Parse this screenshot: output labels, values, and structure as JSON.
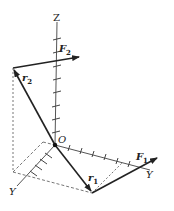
{
  "diagram": {
    "type": "3d-vector-diagram",
    "axes": {
      "z_label": "Z",
      "y_label": "Y",
      "x_label": "Y",
      "origin_label": "O"
    },
    "vectors": [
      {
        "name": "r1",
        "label": "r",
        "subscript": "1",
        "from": "O",
        "kind": "position"
      },
      {
        "name": "F1",
        "label": "F",
        "subscript": "1",
        "from": "tip of r1",
        "kind": "force"
      },
      {
        "name": "r2",
        "label": "r",
        "subscript": "2",
        "from": "O",
        "kind": "position"
      },
      {
        "name": "F2",
        "label": "F",
        "subscript": "2",
        "from": "tip of r2",
        "kind": "force"
      }
    ],
    "colors": {
      "ink": "#222222",
      "axis": "#555555",
      "dashed": "#666666",
      "background": "#ffffff"
    }
  }
}
